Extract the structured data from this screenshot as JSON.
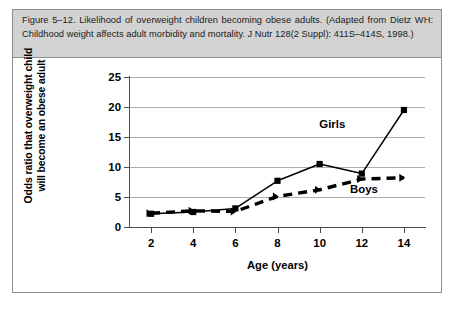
{
  "figure": {
    "caption": "Figure 5–12. Likelihood of overweight children becoming obese adults. (Adapted from Dietz WH: Childhood weight affects adult morbidity and mortality. J Nutr 128(2 Suppl): 411S–414S, 1998.)",
    "border_color": "#8d8d8d",
    "caption_background": "#d2d2d2"
  },
  "chart_data": {
    "type": "line",
    "title": "",
    "xlabel": "Age (years)",
    "ylabel": "Odds ratio that overweight child will become an obese adult",
    "ylabel_line1": "Odds ratio that overweight child",
    "ylabel_line2": "will become an obese adult",
    "x": [
      2,
      4,
      6,
      8,
      10,
      12,
      14
    ],
    "xticklabels": [
      "2",
      "4",
      "6",
      "8",
      "10",
      "12",
      "14"
    ],
    "yticks": [
      0,
      5,
      10,
      15,
      20,
      25
    ],
    "yticklabels": [
      "0",
      "5",
      "10",
      "15",
      "20",
      "25"
    ],
    "xlim": [
      1,
      15
    ],
    "ylim": [
      0,
      25
    ],
    "grid": "horizontal",
    "legend": "inline-annotations",
    "series": [
      {
        "name": "Girls",
        "values": [
          2.2,
          2.5,
          3.1,
          7.7,
          10.5,
          8.9,
          19.5
        ],
        "style": "solid",
        "marker": "square",
        "color": "#000000",
        "label_x": 10.6,
        "label_y": 17.2
      },
      {
        "name": "Boys",
        "values": [
          2.3,
          2.7,
          2.6,
          5.1,
          6.2,
          8.0,
          8.2
        ],
        "style": "dashed",
        "marker": "arrow",
        "color": "#000000",
        "label_x": 12.1,
        "label_y": 6.3
      }
    ]
  }
}
